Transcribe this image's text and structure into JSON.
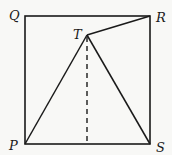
{
  "diagram": {
    "type": "geometry",
    "colors": {
      "line": "#1a1a1a",
      "background": "#f8f8f6"
    },
    "points": {
      "Q": {
        "label": "Q",
        "x": 25,
        "y": 16
      },
      "R": {
        "label": "R",
        "x": 150,
        "y": 16
      },
      "P": {
        "label": "P",
        "x": 25,
        "y": 144
      },
      "S": {
        "label": "S",
        "x": 150,
        "y": 144
      },
      "T": {
        "label": "T",
        "x": 87,
        "y": 35
      }
    },
    "segments": [
      {
        "from": "P",
        "to": "Q",
        "style": "solid"
      },
      {
        "from": "Q",
        "to": "R",
        "style": "solid"
      },
      {
        "from": "R",
        "to": "S",
        "style": "solid"
      },
      {
        "from": "S",
        "to": "P",
        "style": "solid"
      },
      {
        "from": "P",
        "to": "T",
        "style": "solid"
      },
      {
        "from": "T",
        "to": "S",
        "style": "solid"
      },
      {
        "from": "T",
        "to": "R",
        "style": "solid"
      },
      {
        "from": "T",
        "to": "foot",
        "style": "dashed"
      }
    ],
    "labels": {
      "Q": "Q",
      "R": "R",
      "T": "T",
      "P": "P",
      "S": "S"
    }
  }
}
